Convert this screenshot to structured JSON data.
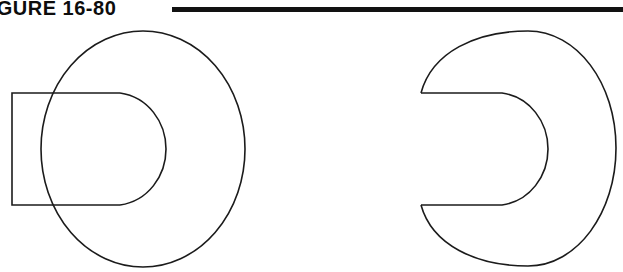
{
  "figure": {
    "label": "FIGURE 16-80",
    "label_truncated_left": true,
    "rule_color": "#121212",
    "ink_color": "#1b1b1b",
    "background_color": "#ffffff"
  },
  "canvas": {
    "width": 623,
    "height": 272
  },
  "views": [
    {
      "name": "front-view-with-overlaid-rectangle",
      "description": "Large ellipse outline with an overlapping rectangle on the left and an inner slot arc",
      "ellipse": {
        "cx": 143,
        "cy": 149,
        "rx": 102,
        "ry": 118
      },
      "rectangle": {
        "x": 12,
        "y": 93,
        "width": 108,
        "height": 112
      },
      "slot_arc": {
        "start_x": 120,
        "start_y": 93,
        "end_x": 120,
        "end_y": 205,
        "rx": 46,
        "ry": 58,
        "bulge_x": 166
      }
    },
    {
      "name": "side-view-slotted-disc",
      "description": "Ellipse outline with a rectangular notch cut from the left side ending in a rounded arc",
      "ellipse": {
        "cx": 528,
        "cy": 148,
        "rx": 96,
        "ry": 117
      },
      "notch": {
        "mouth_x": 421,
        "top_y": 93,
        "bottom_y": 205,
        "flat_end_x": 502,
        "bulge_x": 548
      }
    }
  ]
}
